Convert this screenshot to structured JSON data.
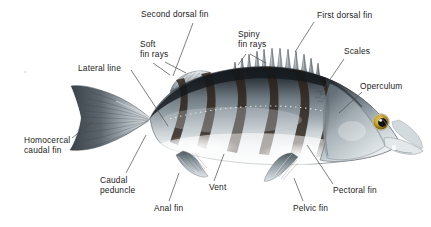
{
  "figure": {
    "background_color": "#ffffff",
    "text_color": "#1b1b1b",
    "leader_line_color": "#4a4a4a",
    "width": 431,
    "height": 227
  },
  "labels": [
    {
      "id": "second-dorsal-fin",
      "text": "Second dorsal fin",
      "x": 141,
      "y": 9,
      "align": "left",
      "leaders": [
        [
          193,
          23,
          173,
          76
        ]
      ]
    },
    {
      "id": "first-dorsal-fin",
      "text": "First dorsal fin",
      "x": 317,
      "y": 10,
      "align": "left",
      "leaders": [
        [
          314,
          22,
          295,
          52
        ]
      ]
    },
    {
      "id": "spiny-fin-rays",
      "text": "Spiny\nfin rays",
      "x": 238,
      "y": 29,
      "align": "left",
      "leaders": [
        [
          246,
          54,
          238,
          65
        ],
        [
          250,
          54,
          266,
          63
        ]
      ]
    },
    {
      "id": "soft-fin-rays",
      "text": "Soft\nfin rays",
      "x": 140,
      "y": 39,
      "align": "left",
      "leaders": [
        [
          153,
          63,
          170,
          75
        ],
        [
          165,
          62,
          186,
          73
        ]
      ]
    },
    {
      "id": "scales",
      "text": "Scales",
      "x": 344,
      "y": 46,
      "align": "left",
      "leaders": [
        [
          344,
          59,
          320,
          94
        ]
      ]
    },
    {
      "id": "lateral-line",
      "text": "Lateral line",
      "x": 78,
      "y": 63,
      "align": "left",
      "leaders": [
        [
          131,
          70,
          168,
          126
        ]
      ]
    },
    {
      "id": "operculum",
      "text": "Operculum",
      "x": 360,
      "y": 81,
      "align": "left",
      "leaders": [
        [
          362,
          92,
          339,
          113
        ]
      ]
    },
    {
      "id": "homocercal-caudal-fin",
      "text": "Homocercal\ncaudal fin",
      "x": 24,
      "y": 135,
      "align": "left",
      "leaders": [
        [
          72,
          138,
          92,
          122
        ]
      ]
    },
    {
      "id": "caudal-peduncle",
      "text": "Caudal\npeduncle",
      "x": 100,
      "y": 175,
      "align": "left",
      "leaders": [
        [
          126,
          173,
          146,
          135
        ]
      ]
    },
    {
      "id": "vent",
      "text": "Vent",
      "x": 209,
      "y": 182,
      "align": "left",
      "leaders": [
        [
          214,
          181,
          224,
          154
        ]
      ]
    },
    {
      "id": "anal-fin",
      "text": "Anal fin",
      "x": 154,
      "y": 203,
      "align": "left",
      "leaders": [
        [
          169,
          201,
          179,
          173
        ]
      ]
    },
    {
      "id": "pelvic-fin",
      "text": "Pelvic fin",
      "x": 293,
      "y": 203,
      "align": "left",
      "leaders": [
        [
          303,
          201,
          294,
          178
        ]
      ]
    },
    {
      "id": "pectoral-fin",
      "text": "Pectoral fin",
      "x": 333,
      "y": 185,
      "align": "left",
      "leaders": [
        [
          333,
          184,
          307,
          145
        ]
      ]
    }
  ],
  "anatomy_parts": [
    "Second dorsal fin",
    "First dorsal fin",
    "Spiny fin rays",
    "Soft fin rays",
    "Scales",
    "Lateral line",
    "Operculum",
    "Homocercal caudal fin",
    "Caudal peduncle",
    "Vent",
    "Anal fin",
    "Pelvic fin",
    "Pectoral fin"
  ],
  "illustration": {
    "body_top_color": "#2f3338",
    "body_mid_color": "#8e989f",
    "body_belly_color": "#f4f6f7",
    "fin_color": "#9aa4ac",
    "fin_dark_color": "#4d565d",
    "band_color": "#30241d",
    "eye_iris_color": "#c9a227",
    "eye_pupil_color": "#141414",
    "bands": 6,
    "spiny_dorsal_spines": 13,
    "soft_dorsal_rays": 11,
    "caudal_fin_rays": 13,
    "anal_fin_rays": 8,
    "pelvic_fin_rays": 6,
    "pectoral_fin_rays": 7,
    "lateral_line_dots": 34
  }
}
